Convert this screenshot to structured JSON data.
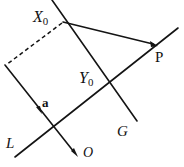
{
  "figure": {
    "background_color": "#ffffff",
    "stroke_color": "#141414",
    "canvas": {
      "width": 184,
      "height": 167
    },
    "labels": {
      "x0": {
        "base": "X",
        "subscript": "0"
      },
      "y0": {
        "base": "Y",
        "subscript": "0"
      },
      "p": "P",
      "g": "G",
      "l": "L",
      "o": "O",
      "a": "a"
    },
    "geometry": {
      "line_L": {
        "from": [
          15,
          157
        ],
        "to": [
          178,
          28
        ],
        "style": "solid",
        "description": "long diagonal line L through Y0 toward P"
      },
      "line_G": {
        "from": [
          52,
          0
        ],
        "to": [
          137,
          121
        ],
        "style": "solid",
        "description": "line G through X0 and Y0"
      },
      "line_a": {
        "from": [
          5,
          65
        ],
        "to": [
          78,
          157
        ],
        "style": "solid",
        "description": "line carrying vector a, arrow at O"
      },
      "segment_X0_P": {
        "from": [
          63,
          22
        ],
        "to": [
          157,
          45
        ],
        "style": "solid",
        "arrow": "end",
        "description": "segment from X0 to P"
      },
      "dashed_X0_corner": {
        "from": [
          62,
          23
        ],
        "to": [
          6,
          65
        ],
        "style": "dashed",
        "description": "dashed construction line from X0 to corner"
      },
      "point_X0": [
        63,
        22
      ],
      "point_Y0": [
        110,
        88
      ],
      "point_P": [
        157,
        45
      ],
      "point_O": [
        78,
        157
      ],
      "arrow_a": [
        40,
        111
      ]
    }
  }
}
